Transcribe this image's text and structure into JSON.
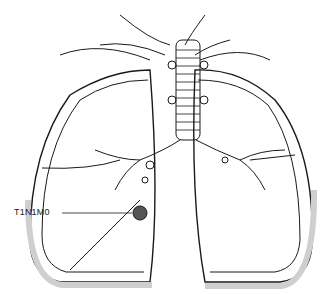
{
  "figure": {
    "stage_label": "T1N1M0",
    "colors": {
      "ink": "#1a1a1a",
      "pleura_fill": "#f2f2f2",
      "background": "#ffffff"
    }
  }
}
